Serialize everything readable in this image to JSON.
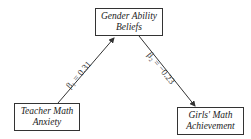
{
  "diagram": {
    "type": "mediation-path-diagram",
    "nodes": [
      {
        "id": "gender_ability_beliefs",
        "line1": "Gender Ability",
        "line2": "Beliefs"
      },
      {
        "id": "teacher_math_anxiety",
        "line1": "Teacher Math",
        "line2": "Anxiety"
      },
      {
        "id": "girls_math_achievement",
        "line1": "Girls' Math",
        "line2": "Achievement"
      }
    ],
    "edges": [
      {
        "from": "teacher_math_anxiety",
        "to": "gender_ability_beliefs",
        "label": "β₁ = 0.31"
      },
      {
        "from": "gender_ability_beliefs",
        "to": "girls_math_achievement",
        "label": "β₂ = −0.23"
      }
    ],
    "colors": {
      "line": "#333333",
      "background": "#ffffff"
    }
  }
}
